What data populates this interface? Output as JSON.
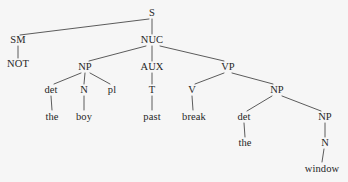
{
  "figure": {
    "name": "syntax-tree-diagram",
    "type": "constituency-tree",
    "sentence": "NOT the boy past break the window",
    "background_color": "#f6f6f6",
    "line_color": "#4a4a4a",
    "text_color": "#262626"
  },
  "nodes": [
    {
      "id": "S",
      "label": "S",
      "kind": "category",
      "x": 152,
      "y": 13
    },
    {
      "id": "SM",
      "label": "SM",
      "kind": "category",
      "x": 18,
      "y": 40
    },
    {
      "id": "NUC",
      "label": "NUC",
      "kind": "category",
      "x": 152,
      "y": 40
    },
    {
      "id": "NOT",
      "label": "NOT",
      "kind": "leaf",
      "x": 18,
      "y": 64
    },
    {
      "id": "NP1",
      "label": "NP",
      "kind": "category",
      "x": 85,
      "y": 67
    },
    {
      "id": "AUX",
      "label": "AUX",
      "kind": "category",
      "x": 152,
      "y": 67
    },
    {
      "id": "VP",
      "label": "VP",
      "kind": "category",
      "x": 228,
      "y": 67
    },
    {
      "id": "det1",
      "label": "det",
      "kind": "category",
      "x": 51,
      "y": 90
    },
    {
      "id": "N1",
      "label": "N",
      "kind": "category",
      "x": 84,
      "y": 90
    },
    {
      "id": "pl",
      "label": "pl",
      "kind": "category",
      "x": 112,
      "y": 90
    },
    {
      "id": "T",
      "label": "T",
      "kind": "category",
      "x": 152,
      "y": 90
    },
    {
      "id": "V",
      "label": "V",
      "kind": "category",
      "x": 192,
      "y": 90
    },
    {
      "id": "NP2",
      "label": "NP",
      "kind": "category",
      "x": 277,
      "y": 90
    },
    {
      "id": "the1",
      "label": "the",
      "kind": "leaf",
      "x": 52,
      "y": 117
    },
    {
      "id": "boy",
      "label": "boy",
      "kind": "leaf",
      "x": 84,
      "y": 117
    },
    {
      "id": "past",
      "label": "past",
      "kind": "leaf",
      "x": 152,
      "y": 117
    },
    {
      "id": "break",
      "label": "break",
      "kind": "leaf",
      "x": 194,
      "y": 117
    },
    {
      "id": "det2",
      "label": "det",
      "kind": "category",
      "x": 244,
      "y": 117
    },
    {
      "id": "NP3",
      "label": "NP",
      "kind": "category",
      "x": 325,
      "y": 117
    },
    {
      "id": "the2",
      "label": "the",
      "kind": "leaf",
      "x": 245,
      "y": 143
    },
    {
      "id": "N2",
      "label": "N",
      "kind": "category",
      "x": 325,
      "y": 143
    },
    {
      "id": "window",
      "label": "window",
      "kind": "leaf",
      "x": 322,
      "y": 169
    }
  ],
  "edges": [
    {
      "from": "S",
      "to": "SM",
      "x1": 149,
      "y1": 19,
      "x2": 20,
      "y2": 35
    },
    {
      "from": "S",
      "to": "NUC",
      "x1": 152,
      "y1": 19,
      "x2": 152,
      "y2": 34
    },
    {
      "from": "SM",
      "to": "NOT",
      "x1": 18,
      "y1": 46,
      "x2": 18,
      "y2": 58
    },
    {
      "from": "NUC",
      "to": "NP1",
      "x1": 146,
      "y1": 46,
      "x2": 89,
      "y2": 61
    },
    {
      "from": "NUC",
      "to": "AUX",
      "x1": 152,
      "y1": 46,
      "x2": 152,
      "y2": 61
    },
    {
      "from": "NUC",
      "to": "VP",
      "x1": 160,
      "y1": 46,
      "x2": 224,
      "y2": 61
    },
    {
      "from": "NP1",
      "to": "det1",
      "x1": 81,
      "y1": 73,
      "x2": 54,
      "y2": 84
    },
    {
      "from": "NP1",
      "to": "N1",
      "x1": 85,
      "y1": 73,
      "x2": 84,
      "y2": 84
    },
    {
      "from": "NP1",
      "to": "pl",
      "x1": 90,
      "y1": 73,
      "x2": 110,
      "y2": 84
    },
    {
      "from": "AUX",
      "to": "T",
      "x1": 152,
      "y1": 73,
      "x2": 152,
      "y2": 84
    },
    {
      "from": "VP",
      "to": "V",
      "x1": 224,
      "y1": 73,
      "x2": 195,
      "y2": 84
    },
    {
      "from": "VP",
      "to": "NP2",
      "x1": 232,
      "y1": 73,
      "x2": 273,
      "y2": 84
    },
    {
      "from": "det1",
      "to": "the1",
      "x1": 51,
      "y1": 96,
      "x2": 52,
      "y2": 110
    },
    {
      "from": "N1",
      "to": "boy",
      "x1": 84,
      "y1": 96,
      "x2": 84,
      "y2": 110
    },
    {
      "from": "T",
      "to": "past",
      "x1": 152,
      "y1": 96,
      "x2": 152,
      "y2": 110
    },
    {
      "from": "V",
      "to": "break",
      "x1": 192,
      "y1": 96,
      "x2": 193,
      "y2": 110
    },
    {
      "from": "NP2",
      "to": "det2",
      "x1": 272,
      "y1": 96,
      "x2": 247,
      "y2": 111
    },
    {
      "from": "NP2",
      "to": "NP3",
      "x1": 282,
      "y1": 96,
      "x2": 321,
      "y2": 111
    },
    {
      "from": "det2",
      "to": "the2",
      "x1": 244,
      "y1": 123,
      "x2": 245,
      "y2": 137
    },
    {
      "from": "NP3",
      "to": "N2",
      "x1": 325,
      "y1": 123,
      "x2": 325,
      "y2": 137
    },
    {
      "from": "N2",
      "to": "window",
      "x1": 324,
      "y1": 149,
      "x2": 322,
      "y2": 162
    }
  ]
}
